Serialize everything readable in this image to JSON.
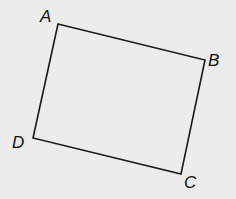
{
  "diagram": {
    "type": "quadrilateral",
    "background": "#ececec",
    "stroke": "#1a1a1a",
    "vertices": [
      {
        "label": "A",
        "x": 58,
        "y": 24,
        "lx": 40,
        "ly": 22
      },
      {
        "label": "B",
        "x": 205,
        "y": 60,
        "lx": 208,
        "ly": 66
      },
      {
        "label": "C",
        "x": 181,
        "y": 174,
        "lx": 184,
        "ly": 188
      },
      {
        "label": "D",
        "x": 33,
        "y": 138,
        "lx": 12,
        "ly": 148
      }
    ]
  }
}
